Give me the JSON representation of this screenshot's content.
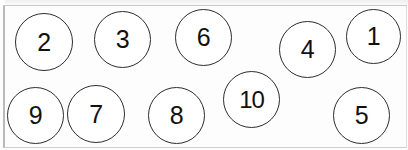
{
  "diagram": {
    "background_color": "#fdfdfd",
    "stroke_color": "#2d2d2d",
    "text_color": "#111111",
    "canvas": {
      "width": 408,
      "height": 150
    },
    "nodes": [
      {
        "label": "2",
        "x": 15,
        "y": 13,
        "size": 58
      },
      {
        "label": "3",
        "x": 94,
        "y": 11,
        "size": 57
      },
      {
        "label": "6",
        "x": 175,
        "y": 9,
        "size": 57
      },
      {
        "label": "4",
        "x": 279,
        "y": 21,
        "size": 57
      },
      {
        "label": "1",
        "x": 346,
        "y": 9,
        "size": 55
      },
      {
        "label": "9",
        "x": 7,
        "y": 87,
        "size": 57
      },
      {
        "label": "7",
        "x": 67,
        "y": 85,
        "size": 58
      },
      {
        "label": "8",
        "x": 148,
        "y": 87,
        "size": 57
      },
      {
        "label": "10",
        "x": 223,
        "y": 71,
        "size": 57
      },
      {
        "label": "5",
        "x": 333,
        "y": 87,
        "size": 57
      }
    ]
  }
}
